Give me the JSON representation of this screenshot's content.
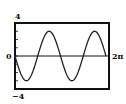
{
  "chart_data": {
    "type": "line",
    "title": "",
    "xlabel": "",
    "ylabel": "",
    "function": "y = -3 sin(2x)",
    "xlim": [
      0,
      6.2832
    ],
    "ylim": [
      -4,
      4
    ],
    "x_tick_labels": [
      "0",
      "2π"
    ],
    "y_tick_labels": [
      "4",
      "0",
      "-4"
    ],
    "grid": false,
    "legend": null,
    "series": [
      {
        "name": "y",
        "x": [
          0,
          0.3927,
          0.7854,
          1.1781,
          1.5708,
          1.9635,
          2.3562,
          2.7489,
          3.1416,
          3.5343,
          3.927,
          4.3197,
          4.7124,
          5.1051,
          5.4978,
          5.8905,
          6.2832
        ],
        "values": [
          0,
          -2.12,
          -3,
          -2.12,
          0,
          2.12,
          3,
          2.12,
          0,
          -2.12,
          -3,
          -2.12,
          0,
          2.12,
          3,
          2.12,
          0
        ]
      }
    ]
  },
  "labels": {
    "ymax": "4",
    "ymin": "−4",
    "origin": "0",
    "xmax": "2π"
  }
}
